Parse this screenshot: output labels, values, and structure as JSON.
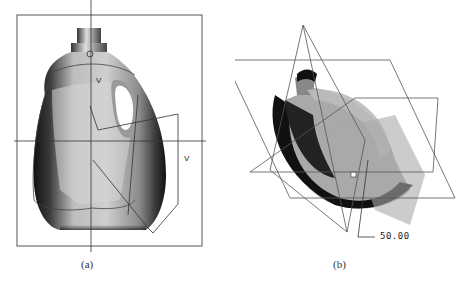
{
  "figure": {
    "panels": [
      {
        "id": "a",
        "caption": "(a)",
        "subject": "bottle-front-view-with-cross-section-sketch",
        "labels": [
          "V",
          "V"
        ]
      },
      {
        "id": "b",
        "caption": "(b)",
        "subject": "bottle-isometric-view-with-datum-planes",
        "dimension": "50.00"
      }
    ]
  },
  "colors": {
    "frame": "#555555",
    "axis": "#333333",
    "bottle_dark": "#1a1a1a",
    "bottle_mid": "#9a9a9a",
    "bottle_light": "#e6e6e6",
    "plane_line": "#555555"
  }
}
